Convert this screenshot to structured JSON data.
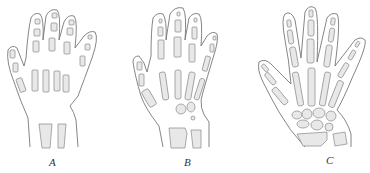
{
  "figure": {
    "panels": [
      {
        "label": "A",
        "description": "Infant hand skeleton - few ossified bones"
      },
      {
        "label": "B",
        "description": "Child hand skeleton - partial ossification"
      },
      {
        "label": "C",
        "description": "Adult hand skeleton - fully ossified"
      }
    ]
  },
  "colors": {
    "line": "#777777",
    "bone_fill": "#e8e8e8",
    "background": "#ffffff"
  }
}
